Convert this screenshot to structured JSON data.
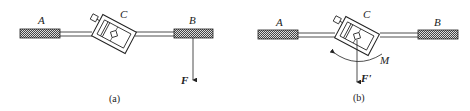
{
  "panels": [
    {
      "caption": "(a)",
      "labels": {
        "left_handle": "A",
        "body": "C",
        "right_handle": "B",
        "force": "F"
      }
    },
    {
      "caption": "(b)",
      "labels": {
        "left_handle": "A",
        "body": "C",
        "right_handle": "B",
        "force": "F'",
        "moment": "M"
      }
    }
  ],
  "colors": {
    "line": "#222222",
    "background": "#ffffff"
  }
}
